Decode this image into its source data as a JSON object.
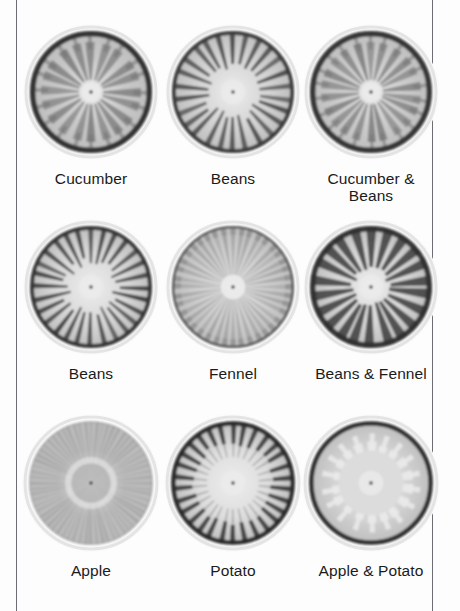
{
  "figure": {
    "clipped_top_caption": "",
    "background_color": "#fdfdfd",
    "rule_color": "#6e6e72"
  },
  "chart_data": {
    "type": "table",
    "title": "",
    "rows": 3,
    "columns": 3,
    "categories": [
      "Cucumber",
      "Beans",
      "Cucumber & Beans",
      "Beans",
      "Fennel",
      "Beans & Fennel",
      "Apple",
      "Potato",
      "Apple & Potato"
    ],
    "cells": [
      {
        "row": 1,
        "col": 1,
        "label": "Cucumber",
        "label_lines": [
          "Cucumber"
        ],
        "pattern": "lobed-petal",
        "rim": "dark-thick",
        "center": "pale",
        "rays": 20,
        "ray_color": "#6d6d6d",
        "fill_color": "#c9c9c9",
        "rim_color": "#2e2e2e"
      },
      {
        "row": 1,
        "col": 2,
        "label": "Beans",
        "label_lines": [
          "Beans"
        ],
        "pattern": "inward-spikes",
        "rim": "dark-medium",
        "center": "pale",
        "rays": 26,
        "ray_color": "#4a4a4a",
        "fill_color": "#d6d6d6",
        "rim_color": "#3a3a3a"
      },
      {
        "row": 1,
        "col": 3,
        "label": "Cucumber & Beans",
        "label_lines": [
          "Cucumber &",
          "Beans"
        ],
        "pattern": "lobed-petal",
        "rim": "dark-thick",
        "center": "pale",
        "rays": 22,
        "ray_color": "#707070",
        "fill_color": "#cccccc",
        "rim_color": "#303030"
      },
      {
        "row": 2,
        "col": 1,
        "label": "Beans",
        "label_lines": [
          "Beans"
        ],
        "pattern": "inward-spikes",
        "rim": "dark-medium",
        "center": "pale",
        "rays": 28,
        "ray_color": "#3f3f3f",
        "fill_color": "#dadada",
        "rim_color": "#343434"
      },
      {
        "row": 2,
        "col": 2,
        "label": "Fennel",
        "label_lines": [
          "Fennel"
        ],
        "pattern": "fine-cog",
        "rim": "toothed",
        "center": "pale",
        "rays": 40,
        "ray_color": "#888888",
        "fill_color": "#d2d2d2",
        "rim_color": "#5a5a5a"
      },
      {
        "row": 2,
        "col": 3,
        "label": "Beans & Fennel",
        "label_lines": [
          "Beans & Fennel"
        ],
        "pattern": "wedge-rays",
        "rim": "dark-thick",
        "center": "pale",
        "rays": 22,
        "ray_color": "#3c3c3c",
        "fill_color": "#d8d8d8",
        "rim_color": "#2f2f2f"
      },
      {
        "row": 3,
        "col": 1,
        "label": "Apple",
        "label_lines": [
          "Apple"
        ],
        "pattern": "fine-striate",
        "rim": "soft",
        "center": "dark-core",
        "rays": 64,
        "ray_color": "#9a9a9a",
        "fill_color": "#bfbfbf",
        "rim_color": "#a5a5a5"
      },
      {
        "row": 3,
        "col": 2,
        "label": "Potato",
        "label_lines": [
          "Potato"
        ],
        "pattern": "comb-teeth",
        "rim": "dark-band",
        "center": "pale",
        "rays": 30,
        "ray_color": "#3a3a3a",
        "fill_color": "#dedede",
        "rim_color": "#2b2b2b"
      },
      {
        "row": 3,
        "col": 3,
        "label": "Apple & Potato",
        "label_lines": [
          "Apple & Potato"
        ],
        "pattern": "flame-tongues",
        "rim": "dark-band",
        "center": "pale",
        "rays": 18,
        "ray_color": "#333333",
        "fill_color": "#d5d5d5",
        "rim_color": "#2a2a2a"
      }
    ]
  }
}
